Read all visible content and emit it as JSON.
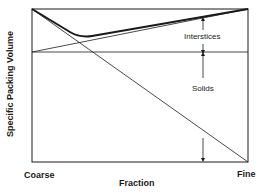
{
  "diagram": {
    "type": "packing-volume-diagram",
    "y_axis_label": "Specific Packing Volume",
    "x_axis_label": "Fraction",
    "x_left_label": "Coarse",
    "x_right_label": "Fine",
    "annotations": {
      "interstices": "Interstices",
      "solids": "Solids"
    },
    "colors": {
      "line": "#1a1a1a",
      "background": "#ffffff"
    }
  }
}
